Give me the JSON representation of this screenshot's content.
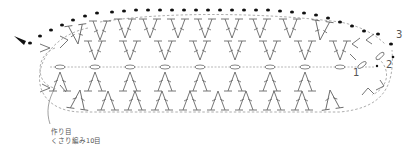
{
  "diagram": {
    "type": "crochet-chart",
    "ink_color": "#666666",
    "dot_color": "#111111",
    "center_line_y": 67,
    "foundation_chain_x": [
      60,
      95,
      130,
      165,
      200,
      235,
      270,
      305,
      340
    ],
    "upper_v_columns_x": [
      60,
      95,
      130,
      165,
      200,
      235,
      270,
      305,
      340
    ],
    "row_labels": [
      {
        "id": "row-1",
        "text": "1",
        "x": 353,
        "y": 68
      },
      {
        "id": "row-2",
        "text": "2",
        "x": 386,
        "y": 60
      },
      {
        "id": "row-3",
        "text": "3",
        "x": 396,
        "y": 30
      }
    ],
    "start_marker": "arrow-triangle-icon",
    "legend": {
      "line1": "作り目",
      "line2": "くさり編み10目"
    },
    "symbols": {
      "chain": "ellipse",
      "slip_stitch": "filled-dot",
      "double_crochet": "T-post-with-slash",
      "dc_increase": "V-shape",
      "dc_decrease": "lambda-shape"
    }
  }
}
